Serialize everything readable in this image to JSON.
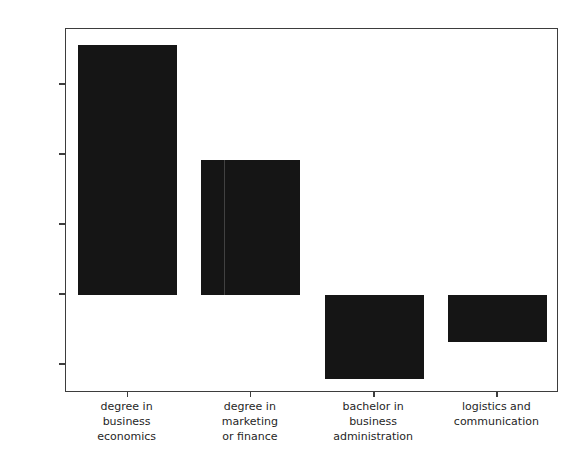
{
  "chart_data": {
    "type": "bar",
    "title": "",
    "xlabel": "",
    "ylabel": "Skill Difference",
    "categories": [
      "degree in\nbusiness\neconomics",
      "degree in\nmarketing\nor finance",
      "bachelor in\nbusiness\nadministration",
      "logistics and\ncommunication"
    ],
    "values": [
      71.3,
      38.6,
      -24.1,
      -13.3
    ],
    "ylim": [
      -28,
      76
    ],
    "yticks": [
      60,
      40,
      20,
      0,
      -20
    ],
    "ytick_labels": [
      "60",
      "40",
      "20",
      "0",
      "-20"
    ],
    "grid": false,
    "legend": false,
    "bar_color": "#151515",
    "axis_color": "#3d3d3d"
  },
  "axes": {
    "y_title": "Skill Difference"
  }
}
